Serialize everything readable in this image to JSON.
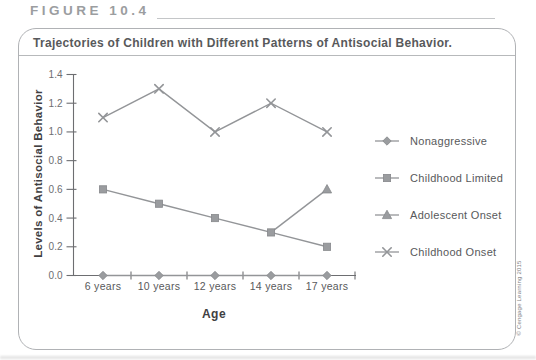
{
  "figure": {
    "label": "FIGURE 10.4",
    "title": "Trajectories of Children with Different Patterns of Antisocial Behavior.",
    "credit": "© Cengage Learning 2015"
  },
  "colors": {
    "series_gray": "#939598",
    "marker_fill": "#9a9c9f",
    "marker_stroke": "#87898c",
    "axis": "#6d6e71",
    "tick_label": "#6d6e71",
    "category_label": "#58595b",
    "heading_gray": "#9b9da0",
    "border": "#b0b2b5"
  },
  "chart_data": {
    "type": "line",
    "categories": [
      "6 years",
      "10 years",
      "12 years",
      "14 years",
      "17 years"
    ],
    "series": [
      {
        "name": "Nonaggressive",
        "marker": "diamond",
        "values": [
          0,
          0,
          0,
          0,
          0
        ]
      },
      {
        "name": "Childhood Limited",
        "marker": "square",
        "values": [
          0.6,
          0.5,
          0.4,
          0.3,
          0.2
        ]
      },
      {
        "name": "Adolescent Onset",
        "marker": "triangle",
        "values": [
          null,
          null,
          null,
          0.3,
          0.6
        ],
        "markers_at": [
          4
        ]
      },
      {
        "name": "Childhood Onset",
        "marker": "x",
        "values": [
          1.1,
          1.3,
          1.0,
          1.2,
          1.0
        ]
      }
    ],
    "title": "",
    "xlabel": "Age",
    "ylabel": "Levels of Antisocial Behavior",
    "ylim": [
      0,
      1.4
    ],
    "ytick_step": 0.2,
    "yticks": [
      "0.0",
      "0.2",
      "0.4",
      "0.6",
      "0.8",
      "1.0",
      "1.2",
      "1.4"
    ],
    "legend_position": "right",
    "grid": false
  }
}
